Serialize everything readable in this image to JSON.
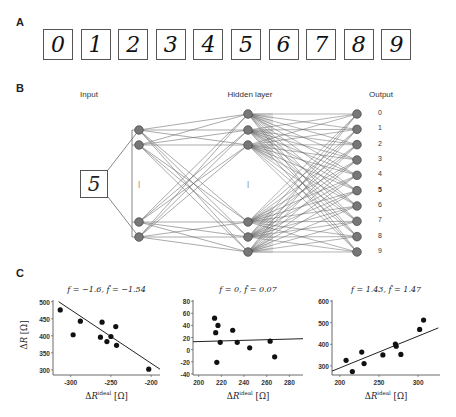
{
  "panels": {
    "a": {
      "letter": "A",
      "digits": [
        "0",
        "1",
        "2",
        "3",
        "4",
        "5",
        "6",
        "7",
        "8",
        "9"
      ]
    },
    "b": {
      "letter": "B",
      "input_label": "Input",
      "hidden_label": "Hidden layer",
      "output_label": "Output",
      "input_digit": "5",
      "output_labels": [
        "0",
        "1",
        "2",
        "3",
        "4",
        "5",
        "6",
        "7",
        "8",
        "9"
      ],
      "highlighted_output": "5",
      "ellipsis": "⁞"
    },
    "c": {
      "letter": "C"
    }
  },
  "chart_data": [
    {
      "type": "scatter",
      "title": "f = −1.6,  f̂ = −1.54",
      "xlabel": "ΔR^ideal [Ω]",
      "ylabel": "ΔR [Ω]",
      "xticks": [
        "-300",
        "-250",
        "-200"
      ],
      "yticks": [
        "500",
        "450",
        "400",
        "350",
        "300"
      ],
      "xlim": [
        -322,
        -189
      ],
      "ylim": [
        285,
        505
      ],
      "points": [
        [
          -313,
          476
        ],
        [
          -297,
          403
        ],
        [
          -288,
          443
        ],
        [
          -263,
          396
        ],
        [
          -261,
          440
        ],
        [
          -255,
          383
        ],
        [
          -250,
          398
        ],
        [
          -244,
          427
        ],
        [
          -243,
          372
        ],
        [
          -203,
          302
        ]
      ],
      "fit_line": {
        "slope": -1.54,
        "x": [
          -315,
          -189
        ],
        "y": [
          500,
          302
        ]
      }
    },
    {
      "type": "scatter",
      "title": "f = 0,  f̂ = 0.07",
      "xlabel": "ΔR^ideal [Ω]",
      "ylabel": "",
      "xticks": [
        "200",
        "220",
        "240",
        "260",
        "280"
      ],
      "yticks": [
        "80",
        "60",
        "40",
        "20",
        "0",
        "-20",
        "-40"
      ],
      "xlim": [
        195,
        292
      ],
      "ylim": [
        -42,
        82
      ],
      "points": [
        [
          214,
          52
        ],
        [
          215,
          28
        ],
        [
          216,
          -21
        ],
        [
          217,
          40
        ],
        [
          219,
          12
        ],
        [
          230,
          32
        ],
        [
          234,
          12
        ],
        [
          245,
          3
        ],
        [
          263,
          14
        ],
        [
          267,
          -12
        ]
      ],
      "fit_line": {
        "slope": 0.07,
        "x": [
          195,
          292
        ],
        "y": [
          13,
          18
        ]
      }
    },
    {
      "type": "scatter",
      "title": "f = 1.43,  f̂ = 1.47",
      "xlabel": "ΔR^ideal [Ω]",
      "ylabel": "",
      "xticks": [
        "200",
        "250",
        "300"
      ],
      "yticks": [
        "600",
        "500",
        "400",
        "300"
      ],
      "xlim": [
        190,
        328
      ],
      "ylim": [
        258,
        605
      ],
      "points": [
        [
          208,
          326
        ],
        [
          216,
          274
        ],
        [
          228,
          364
        ],
        [
          231,
          311
        ],
        [
          255,
          351
        ],
        [
          271,
          401
        ],
        [
          272,
          391
        ],
        [
          278,
          353
        ],
        [
          302,
          469
        ],
        [
          307,
          512
        ]
      ],
      "fit_line": {
        "slope": 1.47,
        "x": [
          190,
          326
        ],
        "y": [
          276,
          476
        ]
      }
    }
  ]
}
